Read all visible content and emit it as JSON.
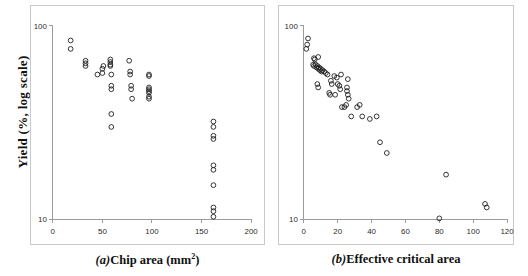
{
  "figure": {
    "y_axis_label": "Yield (%,  log scale)"
  },
  "panel_a": {
    "letter": "(a)",
    "caption_text": "Chip area (mm",
    "caption_sup": "2",
    "caption_tail": ")"
  },
  "panel_b": {
    "letter": "(b)",
    "caption_text": "Effective critical area",
    "caption_sup": "",
    "caption_tail": ""
  },
  "chart_data": [
    {
      "type": "scatter",
      "id": "panel-a",
      "title": "(a) Chip area (mm^2)",
      "xlabel": "Chip area (mm^2)",
      "ylabel": "Yield (%, log scale)",
      "xscale": "linear",
      "yscale": "log",
      "xlim": [
        0,
        200
      ],
      "ylim": [
        10,
        100
      ],
      "xticks": [
        0,
        50,
        100,
        150,
        200
      ],
      "xtick_labels": [
        "0",
        "50",
        "100",
        "150",
        "200"
      ],
      "yticks": [
        10,
        100
      ],
      "ytick_labels": [
        "10",
        "100"
      ],
      "grid": false,
      "legend": "none",
      "marker": "open-circle",
      "points": [
        {
          "x": 18,
          "y": 84
        },
        {
          "x": 18,
          "y": 76
        },
        {
          "x": 33,
          "y": 66
        },
        {
          "x": 33,
          "y": 64
        },
        {
          "x": 33,
          "y": 62
        },
        {
          "x": 45,
          "y": 56
        },
        {
          "x": 50,
          "y": 60
        },
        {
          "x": 50,
          "y": 57
        },
        {
          "x": 51,
          "y": 62
        },
        {
          "x": 58,
          "y": 67
        },
        {
          "x": 58,
          "y": 65
        },
        {
          "x": 58,
          "y": 63
        },
        {
          "x": 58,
          "y": 62
        },
        {
          "x": 59,
          "y": 56
        },
        {
          "x": 59,
          "y": 49
        },
        {
          "x": 59,
          "y": 47
        },
        {
          "x": 59,
          "y": 35
        },
        {
          "x": 59,
          "y": 30
        },
        {
          "x": 77,
          "y": 66
        },
        {
          "x": 78,
          "y": 58
        },
        {
          "x": 78,
          "y": 56
        },
        {
          "x": 79,
          "y": 49
        },
        {
          "x": 79,
          "y": 47
        },
        {
          "x": 80,
          "y": 42
        },
        {
          "x": 97,
          "y": 56
        },
        {
          "x": 97,
          "y": 55
        },
        {
          "x": 97,
          "y": 48
        },
        {
          "x": 97,
          "y": 47
        },
        {
          "x": 97,
          "y": 46
        },
        {
          "x": 97,
          "y": 45
        },
        {
          "x": 97,
          "y": 43
        },
        {
          "x": 97,
          "y": 42
        },
        {
          "x": 162,
          "y": 32
        },
        {
          "x": 162,
          "y": 30
        },
        {
          "x": 162,
          "y": 27
        },
        {
          "x": 162,
          "y": 26
        },
        {
          "x": 162,
          "y": 19
        },
        {
          "x": 162,
          "y": 18
        },
        {
          "x": 162,
          "y": 15
        },
        {
          "x": 162,
          "y": 11.5
        },
        {
          "x": 162,
          "y": 11.0
        },
        {
          "x": 162,
          "y": 10.3
        }
      ]
    },
    {
      "type": "scatter",
      "id": "panel-b",
      "title": "(b) Effective critical area",
      "xlabel": "Effective critical area",
      "ylabel": "Yield (%, log scale)",
      "xscale": "linear",
      "yscale": "log",
      "xlim": [
        0,
        120
      ],
      "ylim": [
        10,
        100
      ],
      "xticks": [
        0,
        20,
        40,
        60,
        80,
        100,
        120
      ],
      "xtick_labels": [
        "0",
        "20",
        "40",
        "60",
        "80",
        "100",
        "120"
      ],
      "yticks": [
        10,
        100
      ],
      "ytick_labels": [
        "10",
        "100"
      ],
      "grid": false,
      "legend": "none",
      "marker": "open-circle",
      "points": [
        {
          "x": 2.5,
          "y": 86
        },
        {
          "x": 2.0,
          "y": 80
        },
        {
          "x": 1.5,
          "y": 76
        },
        {
          "x": 6.0,
          "y": 68
        },
        {
          "x": 6.5,
          "y": 67
        },
        {
          "x": 8.5,
          "y": 69
        },
        {
          "x": 5.5,
          "y": 63
        },
        {
          "x": 6.0,
          "y": 62
        },
        {
          "x": 7.0,
          "y": 63
        },
        {
          "x": 7.5,
          "y": 61
        },
        {
          "x": 8.0,
          "y": 62
        },
        {
          "x": 8.5,
          "y": 60
        },
        {
          "x": 9.0,
          "y": 61
        },
        {
          "x": 9.5,
          "y": 59
        },
        {
          "x": 10.0,
          "y": 60
        },
        {
          "x": 10.5,
          "y": 58
        },
        {
          "x": 11.0,
          "y": 59
        },
        {
          "x": 12.0,
          "y": 58
        },
        {
          "x": 13.0,
          "y": 57
        },
        {
          "x": 14.0,
          "y": 56
        },
        {
          "x": 8.0,
          "y": 50
        },
        {
          "x": 8.5,
          "y": 48
        },
        {
          "x": 16.0,
          "y": 52
        },
        {
          "x": 16.5,
          "y": 50
        },
        {
          "x": 18.0,
          "y": 55
        },
        {
          "x": 19.5,
          "y": 54
        },
        {
          "x": 22.0,
          "y": 56
        },
        {
          "x": 20.0,
          "y": 50
        },
        {
          "x": 21.0,
          "y": 49
        },
        {
          "x": 21.5,
          "y": 47
        },
        {
          "x": 26.0,
          "y": 53
        },
        {
          "x": 25.5,
          "y": 48
        },
        {
          "x": 25.5,
          "y": 46
        },
        {
          "x": 26.0,
          "y": 44
        },
        {
          "x": 15.0,
          "y": 45
        },
        {
          "x": 15.5,
          "y": 44
        },
        {
          "x": 18.5,
          "y": 44
        },
        {
          "x": 26.5,
          "y": 42
        },
        {
          "x": 22.5,
          "y": 38
        },
        {
          "x": 24.0,
          "y": 38
        },
        {
          "x": 25.0,
          "y": 39
        },
        {
          "x": 31.5,
          "y": 38
        },
        {
          "x": 33.0,
          "y": 39
        },
        {
          "x": 28.0,
          "y": 34
        },
        {
          "x": 34.5,
          "y": 34
        },
        {
          "x": 39.0,
          "y": 33
        },
        {
          "x": 43.0,
          "y": 34
        },
        {
          "x": 45.0,
          "y": 25
        },
        {
          "x": 49.0,
          "y": 22
        },
        {
          "x": 84.0,
          "y": 17
        },
        {
          "x": 107.0,
          "y": 12
        },
        {
          "x": 108.0,
          "y": 11.5
        },
        {
          "x": 80.0,
          "y": 10.1
        }
      ]
    }
  ]
}
